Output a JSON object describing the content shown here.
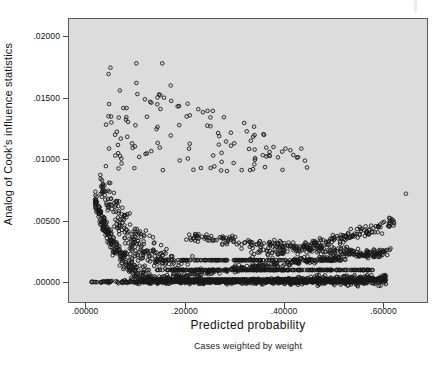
{
  "chart_data": {
    "type": "scatter",
    "title": "",
    "subtitle": "Cases weighted by weight",
    "xlabel": "Predicted probability",
    "ylabel": "Analog of Cook's influence statistics",
    "xlim": [
      -0.0325,
      0.6875
    ],
    "ylim": [
      -0.0016,
      0.0214
    ],
    "xticks": [
      0.0,
      0.2,
      0.4,
      0.6
    ],
    "xtick_labels": [
      ".00000",
      ".20000",
      ".40000",
      ".60000"
    ],
    "yticks": [
      0.0,
      0.005,
      0.01,
      0.015,
      0.02
    ],
    "ytick_labels": [
      ".00000",
      ".00500",
      ".01000",
      ".01500",
      ".02000"
    ],
    "grid": false,
    "legend": null,
    "marker": {
      "shape": "open-circle",
      "diameter_px": 3.6,
      "edge_color": "#181818",
      "fill_color": "none",
      "edge_width": 0.9
    },
    "plot_background": "#dcdcdc",
    "frame_color": "#5a5a5a",
    "page_background": "#ffffff",
    "n_points_approx": 2600,
    "series": [
      {
        "name": "baseline-band",
        "comment": "near-solid dark band hugging y=.00000, thickening and lifting toward right",
        "n": 620,
        "x_range": [
          0.005,
          0.605
        ],
        "y_curve": "y = 0.00022*(x/0.6)^1.9 + jitter(0.00012)"
      },
      {
        "name": "lower-arm",
        "comment": "strand rising from baseline near x=.12 up to ~.0028 at x=.60",
        "n": 300,
        "x_range": [
          0.09,
          0.615
        ],
        "y_curve": "y = 0.0047*(x-0.06)^1.05 + jitter(0.00018)"
      },
      {
        "name": "main-decay-arm",
        "comment": "dominant dense arm decaying from ~.0105 at x=.03 to ~.0022 at x=.55",
        "n": 760,
        "x_range": [
          0.02,
          0.6
        ],
        "y_curve": "y = 0.00085/(x+0.055) - 0.0045 + jitter(0.00055)"
      },
      {
        "name": "upper-decay-arm",
        "comment": "looser upper arm from ~.0120 at x=.04 down to ~.0045 at x=.52",
        "n": 430,
        "x_range": [
          0.03,
          0.58
        ],
        "y_curve": "y = 0.00130/(x+0.075) - 0.0043 + jitter(0.00070)"
      },
      {
        "name": "rising-right-arm",
        "comment": "strand climbing at the right edge to ~.0065 near x=.60",
        "n": 170,
        "x_range": [
          0.33,
          0.625
        ],
        "y_curve": "y = 0.0024 + 0.018*(x-0.33)^1.6 + jitter(0.00030)"
      },
      {
        "name": "high-outliers",
        "comment": "sparse scattered outliers above the main cloud",
        "n": 120,
        "x_range": [
          0.04,
          0.46
        ],
        "y_range": [
          0.009,
          0.0178
        ]
      }
    ],
    "notable_points": [
      {
        "x": 0.103,
        "y": 0.0178,
        "label": "top-left outlier"
      },
      {
        "x": 0.155,
        "y": 0.0178,
        "label": "top outlier"
      },
      {
        "x": 0.103,
        "y": 0.0162,
        "label": "outlier"
      },
      {
        "x": 0.105,
        "y": 0.0153,
        "label": "outlier"
      },
      {
        "x": 0.172,
        "y": 0.016,
        "label": "outlier"
      },
      {
        "x": 0.133,
        "y": 0.0146,
        "label": "outlier"
      },
      {
        "x": 0.186,
        "y": 0.0143,
        "label": "outlier"
      },
      {
        "x": 0.252,
        "y": 0.0134,
        "label": "outlier"
      },
      {
        "x": 0.645,
        "y": 0.0072,
        "label": "isolated far-right point"
      }
    ]
  },
  "axes": {
    "y_title": "Analog of Cook's influence statistics",
    "x_title": "Predicted probability"
  },
  "caption": {
    "text": "Cases weighted by weight"
  }
}
